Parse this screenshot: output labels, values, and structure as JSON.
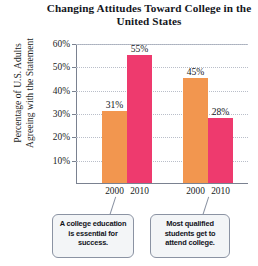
{
  "chart_data": {
    "type": "bar",
    "title": "Changing Attitudes Toward College in the United States",
    "title_line1": "Changing Attitudes Toward",
    "title_line2": "College in the United States",
    "xlabel": "",
    "ylabel": "Percentage of U.S. Adults Agreeing with the Statement",
    "ylabel_line1": "Percentage of U.S. Adults",
    "ylabel_line2": "Agreeing with the Statement",
    "ylim": [
      0,
      60
    ],
    "ytick_values": [
      10,
      20,
      30,
      40,
      50,
      60
    ],
    "ytick_labels": [
      "10%",
      "20%",
      "30%",
      "40%",
      "50%",
      "60%"
    ],
    "grid": true,
    "legend": "none",
    "categories": [
      "2000",
      "2010"
    ],
    "groups": [
      {
        "name": "A college education is essential for success.",
        "bars": [
          {
            "category": "2000",
            "value": 31,
            "label": "31%",
            "color": "#F2964F"
          },
          {
            "category": "2010",
            "value": 55,
            "label": "55%",
            "color": "#EE3A6E"
          }
        ]
      },
      {
        "name": "Most qualified students get to attend college.",
        "bars": [
          {
            "category": "2000",
            "value": 45,
            "label": "45%",
            "color": "#F2964F"
          },
          {
            "category": "2010",
            "value": 28,
            "label": "28%",
            "color": "#EE3A6E"
          }
        ]
      }
    ],
    "series": [
      {
        "name": "2000",
        "values": [
          31,
          45
        ],
        "color": "#F2964F"
      },
      {
        "name": "2010",
        "values": [
          55,
          28
        ],
        "color": "#EE3A6E"
      }
    ],
    "annotations": [
      {
        "id": "callout-left",
        "lines": [
          "A college education",
          "is essential for",
          "success."
        ]
      },
      {
        "id": "callout-right",
        "lines": [
          "Most qualified",
          "students get to",
          "attend college."
        ]
      }
    ],
    "colors": {
      "bar_2000": "#F2964F",
      "bar_2010": "#EE3A6E",
      "axis": "#7a8190",
      "grid": "#b9bec9",
      "callout_border": "#8b93a3",
      "callout_fill": "#f3f5f7",
      "text": "#15171d"
    }
  }
}
